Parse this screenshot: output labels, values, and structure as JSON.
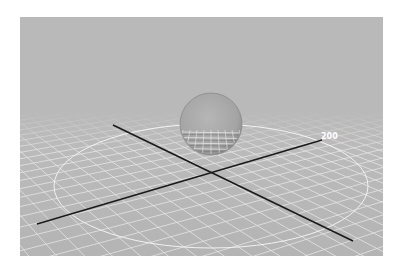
{
  "viewport": {
    "name": "3d-viewport",
    "background_top": "#b9b9b9",
    "background_bottom": "#b4b4b4",
    "grid_color": "#e8e8e8",
    "axis_color": "#1a1a1a",
    "circle_color": "#f2f2f2",
    "sphere_color": "#a9a9a9"
  },
  "scene": {
    "axis_label": "200",
    "sphere": {
      "cx": 191,
      "cy": 107,
      "r": 31
    },
    "circle": {
      "cx": 191,
      "cy": 169,
      "rx": 157,
      "ry": 62
    },
    "axes": [
      {
        "x1": 17,
        "y1": 207,
        "x2": 302,
        "y2": 123
      },
      {
        "x1": 93,
        "y1": 108,
        "x2": 333,
        "y2": 224
      }
    ],
    "label_pos": {
      "x": 301,
      "y": 122
    }
  }
}
